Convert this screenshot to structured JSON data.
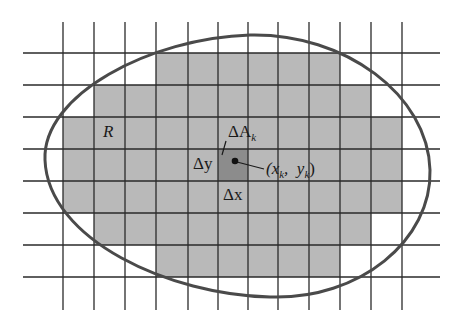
{
  "diagram": {
    "title": "",
    "colors": {
      "background": "#ffffff",
      "grid_line": "#2a2a2a",
      "shaded_cell": "#b9b9b9",
      "highlight_cell": "#8c8c8c",
      "boundary": "#4a4a4a",
      "point": "#111111"
    },
    "grid": {
      "vertical_lines_x": [
        63,
        94,
        125,
        156,
        188,
        218,
        248,
        278,
        309,
        340,
        371,
        402
      ],
      "horizontal_lines_y": [
        53,
        85,
        117,
        149,
        181,
        213,
        245,
        277
      ],
      "vertical_extent": [
        22,
        310
      ],
      "horizontal_extent": [
        23,
        440
      ]
    },
    "shaded_rows": [
      {
        "y0": 53,
        "y1": 85,
        "x0": 156,
        "x1": 340
      },
      {
        "y0": 85,
        "y1": 117,
        "x0": 94,
        "x1": 371
      },
      {
        "y0": 117,
        "y1": 149,
        "x0": 63,
        "x1": 402
      },
      {
        "y0": 149,
        "y1": 181,
        "x0": 63,
        "x1": 402
      },
      {
        "y0": 181,
        "y1": 213,
        "x0": 63,
        "x1": 402
      },
      {
        "y0": 213,
        "y1": 245,
        "x0": 94,
        "x1": 371
      },
      {
        "y0": 245,
        "y1": 277,
        "x0": 156,
        "x1": 340
      }
    ],
    "highlight_cell": {
      "x0": 218,
      "y0": 149,
      "x1": 248,
      "y1": 181
    },
    "point": {
      "x": 235,
      "y": 161
    },
    "labels": {
      "region": "R",
      "area_element": "ΔA",
      "area_element_sub": "k",
      "delta_y": "Δy",
      "delta_x": "Δx",
      "point_open": "(x",
      "point_sub1": "k",
      "point_mid": ",  y",
      "point_sub2": "k",
      "point_close": ")"
    }
  }
}
